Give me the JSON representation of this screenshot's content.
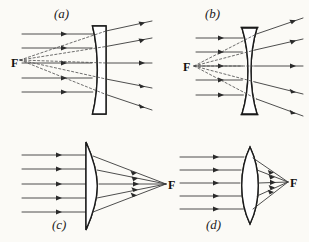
{
  "figure": {
    "background_color": "#fbfaf6",
    "ink_color": "#2a2a2a",
    "width": 309,
    "height": 242
  },
  "panels": [
    {
      "id": "a",
      "label": "(a)",
      "label_x": 62,
      "label_y": 17,
      "lens_type": "plano-concave",
      "behavior": "diverging",
      "focus_label": "F",
      "focus_x": 12,
      "focus_y": 62,
      "focus_side": "left",
      "focal_point": {
        "x": 20,
        "y": 60
      },
      "lens": {
        "x_center": 99,
        "top": 26,
        "bottom": 114,
        "thickness": 13
      },
      "incoming_ray_ys": [
        34,
        48,
        63,
        78,
        92
      ],
      "ray_start_x": 22,
      "virtual_rays": true
    },
    {
      "id": "b",
      "label": "(b)",
      "label_x": 213,
      "label_y": 17,
      "lens_type": "biconcave",
      "behavior": "diverging",
      "focus_label": "F",
      "focus_x": 186,
      "focus_y": 68,
      "focus_side": "left",
      "focal_point": {
        "x": 194,
        "y": 66
      },
      "lens": {
        "x_center": 249,
        "top": 28,
        "bottom": 114,
        "thickness": 14
      },
      "incoming_ray_ys": [
        38,
        52,
        66,
        80,
        95
      ],
      "ray_start_x": 196,
      "virtual_rays": true
    },
    {
      "id": "c",
      "label": "(c)",
      "label_x": 60,
      "label_y": 228,
      "lens_type": "plano-convex",
      "behavior": "converging",
      "focus_label": "F",
      "focus_x": 170,
      "focus_y": 188,
      "focus_side": "right",
      "focal_point": {
        "x": 166,
        "y": 184
      },
      "lens": {
        "x_center": 93,
        "top": 142,
        "bottom": 230,
        "thickness": 15
      },
      "incoming_ray_ys": [
        155,
        169,
        184,
        198,
        212
      ],
      "ray_start_x": 22,
      "virtual_rays": false
    },
    {
      "id": "d",
      "label": "(d)",
      "label_x": 214,
      "label_y": 228,
      "lens_type": "biconvex",
      "behavior": "converging",
      "focus_label": "F",
      "focus_x": 292,
      "focus_y": 186,
      "focus_side": "right",
      "focal_point": {
        "x": 288,
        "y": 182
      },
      "lens": {
        "x_center": 250,
        "top": 147,
        "bottom": 224,
        "thickness": 17
      },
      "incoming_ray_ys": [
        157,
        170,
        183,
        196,
        209
      ],
      "ray_start_x": 180,
      "virtual_rays": false
    }
  ]
}
